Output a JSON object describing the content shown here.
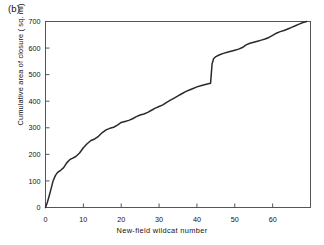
{
  "figure": {
    "panel_label": "(b)",
    "background": "#ffffff",
    "line_color": "#2a2a2a",
    "axis_color": "#555555"
  },
  "chart_data": {
    "type": "line",
    "title": "",
    "panel": "(b)",
    "xlabel": "New-field wildcat number",
    "ylabel": "Cumulative area of closure ( sq. mi)",
    "xlim": [
      0,
      70
    ],
    "ylim": [
      0,
      700
    ],
    "xticks": [
      0,
      10,
      20,
      30,
      40,
      50,
      60
    ],
    "yticks": [
      0,
      100,
      200,
      300,
      400,
      500,
      600,
      700
    ],
    "xtick_labels": [
      "0",
      "10",
      "20",
      "30",
      "40",
      "50",
      "60"
    ],
    "ytick_labels": [
      "0",
      "100",
      "200",
      "300",
      "400",
      "500",
      "600",
      "700"
    ],
    "grid": false,
    "legend": false,
    "frame": "box",
    "series": [
      {
        "name": "Cumulative area of closure",
        "x": [
          0,
          0.5,
          1,
          1.5,
          2,
          2.6,
          3.2,
          4,
          4.8,
          5.6,
          6.4,
          7.2,
          8,
          9,
          10,
          11,
          12,
          13,
          14,
          15,
          16,
          17,
          18,
          19,
          20,
          21,
          22,
          23,
          24,
          25,
          26,
          27,
          28,
          29,
          30,
          31,
          32,
          33,
          34,
          35,
          36,
          37,
          38,
          39,
          40,
          41,
          42,
          43,
          43.6,
          44,
          44.4,
          45,
          46,
          47,
          48,
          49,
          50,
          51,
          52,
          53,
          54,
          55,
          56,
          57,
          58,
          59,
          60,
          61,
          62,
          63,
          64,
          65,
          66,
          67,
          68,
          69
        ],
        "y": [
          0,
          20,
          45,
          72,
          100,
          120,
          132,
          140,
          150,
          168,
          180,
          186,
          192,
          205,
          225,
          240,
          252,
          258,
          268,
          282,
          292,
          298,
          302,
          310,
          320,
          324,
          328,
          334,
          342,
          348,
          352,
          358,
          366,
          374,
          380,
          386,
          396,
          404,
          412,
          420,
          428,
          436,
          442,
          448,
          454,
          458,
          462,
          466,
          468,
          540,
          560,
          568,
          575,
          580,
          584,
          588,
          592,
          596,
          602,
          612,
          618,
          622,
          626,
          630,
          634,
          640,
          648,
          656,
          662,
          666,
          672,
          678,
          684,
          690,
          696,
          700
        ]
      }
    ]
  }
}
